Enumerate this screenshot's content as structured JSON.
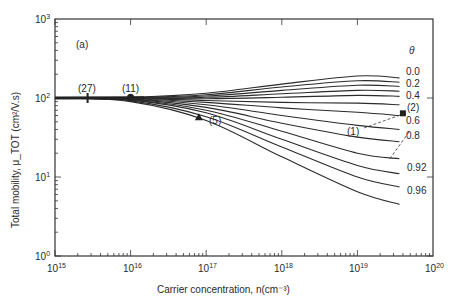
{
  "chart_data": {
    "type": "line",
    "panel_label": "(a)",
    "title": "",
    "xlabel": "Carrier concentration, n(cm⁻³)",
    "ylabel": "Total mobility, μ_TOT (cm²/V.s)",
    "xscale": "log",
    "yscale": "log",
    "xlim": [
      1000000000000000.0,
      1e+20
    ],
    "ylim": [
      1,
      1000
    ],
    "x_ticks": [
      "10^15",
      "10^16",
      "10^17",
      "10^18",
      "10^19",
      "10^20"
    ],
    "y_ticks": [
      "10^0",
      "10^1",
      "10^2",
      "10^3"
    ],
    "grid": false,
    "legend_title": "θ",
    "x": [
      1000000000000000.0,
      1e+16,
      1e+17,
      1e+18,
      1e+19,
      3.6e+19
    ],
    "series": [
      {
        "name": "0.0",
        "values": [
          100,
          102,
          115,
          150,
          190,
          180
        ]
      },
      {
        "name": "0.1",
        "values": [
          100,
          101,
          110,
          138,
          165,
          158
        ]
      },
      {
        "name": "0.2",
        "values": [
          100,
          101,
          106,
          125,
          145,
          140
        ]
      },
      {
        "name": "0.3",
        "values": [
          100,
          100,
          102,
          113,
          125,
          122
        ]
      },
      {
        "name": "0.4",
        "values": [
          100,
          100,
          98,
          102,
          108,
          105
        ]
      },
      {
        "name": "0.5",
        "values": [
          100,
          99,
          93,
          88,
          86,
          82
        ]
      },
      {
        "name": "0.6",
        "values": [
          100,
          98,
          88,
          75,
          66,
          60
        ]
      },
      {
        "name": "0.7",
        "values": [
          100,
          97,
          82,
          60,
          45,
          40
        ]
      },
      {
        "name": "0.8",
        "values": [
          100,
          96,
          76,
          48,
          32,
          28
        ]
      },
      {
        "name": "0.88",
        "values": [
          100,
          95,
          70,
          38,
          20,
          17
        ]
      },
      {
        "name": "0.92",
        "values": [
          100,
          94,
          65,
          30,
          14,
          11
        ]
      },
      {
        "name": "0.96",
        "values": [
          100,
          92,
          58,
          24,
          10,
          7.5
        ]
      },
      {
        "name": "0.98",
        "values": [
          100,
          90,
          52,
          18,
          6.5,
          4.5
        ]
      }
    ],
    "data_points": [
      {
        "label": "(27)",
        "marker": "vertical-tick",
        "x": 2700000000000000.0,
        "y": 100
      },
      {
        "label": "(11)",
        "marker": "circle",
        "x": 1e+16,
        "y": 102
      },
      {
        "label": "(5)",
        "marker": "triangle",
        "x": 8e+16,
        "y": 57
      },
      {
        "label": "(2)",
        "marker": "square",
        "x": 4e+19,
        "y": 64
      },
      {
        "label": "(1)",
        "marker": "dashed-line",
        "x": [
          1e+19,
          4e+19
        ],
        "y": [
          48,
          66
        ]
      }
    ],
    "curve_labels": [
      "0.0",
      "0.2",
      "0.4",
      "0.6",
      "0.8",
      "0.92",
      "0.96"
    ]
  }
}
